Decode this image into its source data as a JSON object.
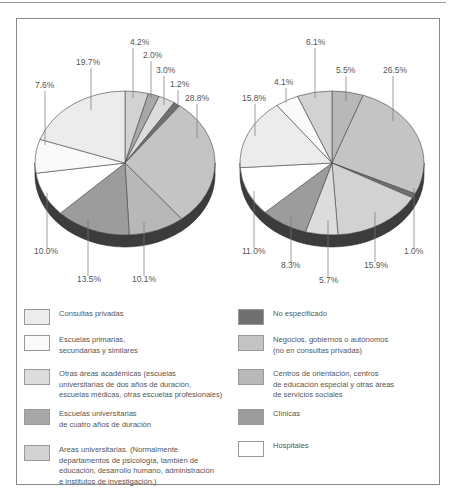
{
  "chart_data": [
    {
      "type": "pie",
      "title": "",
      "style": "3d-pie",
      "start": "12 o'clock, clockwise",
      "slices": [
        {
          "label": "Areas universitarias",
          "value": 4.2,
          "key": "areas"
        },
        {
          "label": "Escuelas universitarias de cuatro años de duración",
          "value": 2.0,
          "key": "cuatro"
        },
        {
          "label": "Otras áreas académicas",
          "value": 3.0,
          "key": "otras"
        },
        {
          "label": "No especificado",
          "value": 1.2,
          "key": "noesp"
        },
        {
          "label": "Negocios, gobiernos o autónomos",
          "value": 28.8,
          "key": "negocios"
        },
        {
          "label": "Centros de orientación",
          "value": 10.1,
          "key": "centros"
        },
        {
          "label": "Clínicas",
          "value": 13.5,
          "key": "clinicas"
        },
        {
          "label": "Hospitales",
          "value": 10.0,
          "key": "hospitales"
        },
        {
          "label": "Escuelas primarias, secundarias y similares",
          "value": 7.6,
          "key": "primarias"
        },
        {
          "label": "Consultas privadas",
          "value": 19.7,
          "key": "consultas"
        }
      ],
      "value_labels": [
        "4.2%",
        "2.0%",
        "3.0%",
        "1.2%",
        "28.8%",
        "10.1%",
        "13.5%",
        "10.0%",
        "7.6%",
        "19.7%"
      ]
    },
    {
      "type": "pie",
      "title": "",
      "style": "3d-pie",
      "start": "12 o'clock, clockwise",
      "slices": [
        {
          "label": "Centros de orientación",
          "value": 5.5,
          "key": "centros"
        },
        {
          "label": "Negocios, gobiernos o autónomos",
          "value": 26.5,
          "key": "negocios"
        },
        {
          "label": "No especificado",
          "value": 1.0,
          "key": "noesp"
        },
        {
          "label": "Areas universitarias",
          "value": 15.9,
          "key": "areas"
        },
        {
          "label": "Otras áreas académicas",
          "value": 5.7,
          "key": "otras"
        },
        {
          "label": "Clínicas",
          "value": 8.3,
          "key": "clinicas"
        },
        {
          "label": "Hospitales",
          "value": 11.0,
          "key": "hospitales"
        },
        {
          "label": "Consultas privadas",
          "value": 15.8,
          "key": "consultas"
        },
        {
          "label": "Escuelas primarias, secundarias y similares",
          "value": 4.1,
          "key": "primarias"
        },
        {
          "label": "Areas universitarias (2)",
          "value": 6.1,
          "key": "areas2"
        }
      ],
      "value_labels": [
        "5.5%",
        "26.5%",
        "1.0%",
        "15.9%",
        "5.7%",
        "8.3%",
        "11.0%",
        "15.8%",
        "4.1%",
        "6.1%"
      ]
    }
  ],
  "colors": {
    "consultas": "#ececec",
    "primarias": "#fafafa",
    "otras": "#dcdcdc",
    "cuatro": "#a8a8a8",
    "areas": "#d2d2d2",
    "areas2": "#d2d2d2",
    "noesp": "#707070",
    "negocios": "#c4c4c4",
    "centros": "#b8b8b8",
    "clinicas": "#9c9c9c",
    "hospitales": "#ffffff",
    "side": "#3c3c3c"
  },
  "legend": {
    "left": [
      {
        "key": "consultas",
        "text": "Consultas privadas"
      },
      {
        "key": "primarias",
        "text": "Escuelas primarias,\nsecundarias y similares"
      },
      {
        "key": "otras",
        "text": "Otras áreas académicas (escuelas\nuniversitarias de dos años de duración,\nescuelas médicas, otras escuelas profesionales)"
      },
      {
        "key": "cuatro",
        "text": "Escuelas universitarias\nde cuatro años de duración"
      },
      {
        "key": "areas",
        "text": "Areas universitarias. (Normalmente\ndepartamentos de psicología, también de\neducación, desarrollo humano, administración\ne institutos de investigación.)"
      }
    ],
    "right": [
      {
        "key": "noesp",
        "text": "No especificado"
      },
      {
        "key": "negocios",
        "text": "Negocios, gobiernos o autónomos\n(no en consultas privadas)"
      },
      {
        "key": "centros",
        "text": "Centros de orientación, centros\nde educación especial y otras áreas\nde servicios sociales"
      },
      {
        "key": "clinicas",
        "text": "Clínicas"
      },
      {
        "key": "hospitales",
        "text": "Hospitales"
      }
    ]
  },
  "labels_left": [
    {
      "text": "4.2%",
      "x": 130,
      "y": 45,
      "lx": 133,
      "ly1": 48,
      "ly2": 98
    },
    {
      "text": "2.0%",
      "x": 143,
      "y": 58,
      "lx": 151,
      "ly1": 61,
      "ly2": 98
    },
    {
      "text": "3.0%",
      "x": 156,
      "y": 73,
      "lx": 164,
      "ly1": 76,
      "ly2": 105
    },
    {
      "text": "1.2%",
      "x": 170,
      "y": 87,
      "lx": 178,
      "ly1": 90,
      "ly2": 104
    },
    {
      "text": "28.8%",
      "x": 185,
      "y": 101,
      "lx": 197,
      "ly1": 104,
      "ly2": 138
    },
    {
      "text": "19.7%",
      "x": 76,
      "y": 65,
      "lx": 91,
      "ly1": 68,
      "ly2": 110
    },
    {
      "text": "7.6%",
      "x": 35,
      "y": 88,
      "lx": 45,
      "ly1": 91,
      "ly2": 145
    },
    {
      "text": "10.0%",
      "x": 34,
      "y": 254,
      "lx": 47,
      "ly1": 193,
      "ly2": 248
    },
    {
      "text": "13.5%",
      "x": 77,
      "y": 282,
      "lx": 88,
      "ly1": 220,
      "ly2": 276
    },
    {
      "text": "10.1%",
      "x": 132,
      "y": 282,
      "lx": 144,
      "ly1": 222,
      "ly2": 276
    }
  ],
  "labels_right": [
    {
      "text": "6.1%",
      "x": 306,
      "y": 45,
      "lx": 315,
      "ly1": 48,
      "ly2": 98
    },
    {
      "text": "5.5%",
      "x": 336,
      "y": 73,
      "lx": 346,
      "ly1": 76,
      "ly2": 101
    },
    {
      "text": "26.5%",
      "x": 383,
      "y": 73,
      "lx": 393,
      "ly1": 76,
      "ly2": 121
    },
    {
      "text": "4.1%",
      "x": 274,
      "y": 85,
      "lx": 286,
      "ly1": 88,
      "ly2": 103
    },
    {
      "text": "15.8%",
      "x": 242,
      "y": 101,
      "lx": 255,
      "ly1": 104,
      "ly2": 136
    },
    {
      "text": "11.0%",
      "x": 242,
      "y": 254,
      "lx": 254,
      "ly1": 191,
      "ly2": 248
    },
    {
      "text": "8.3%",
      "x": 281,
      "y": 268,
      "lx": 291,
      "ly1": 217,
      "ly2": 262
    },
    {
      "text": "5.7%",
      "x": 319,
      "y": 283,
      "lx": 328,
      "ly1": 220,
      "ly2": 277
    },
    {
      "text": "15.9%",
      "x": 364,
      "y": 268,
      "lx": 375,
      "ly1": 212,
      "ly2": 262
    },
    {
      "text": "1.0%",
      "x": 404,
      "y": 254,
      "lx": 414,
      "ly1": 188,
      "ly2": 248
    }
  ]
}
